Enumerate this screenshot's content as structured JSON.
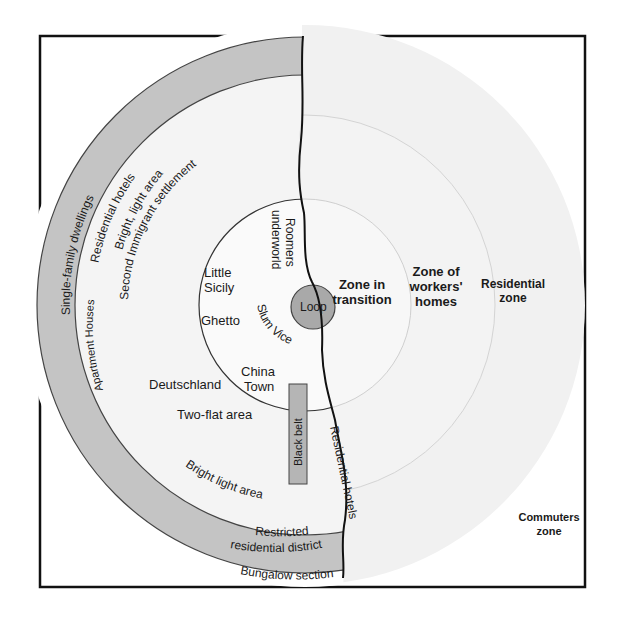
{
  "diagram": {
    "type": "concentric-zone-model",
    "colors": {
      "background": "#ffffff",
      "frame": "#111111",
      "outer_zone_light": "#f1f1f1",
      "inner_zone": "#f7f7f7",
      "grey_band": "#c4c4c4",
      "loop_fill": "#a9a9a9",
      "black_belt_fill": "#b5b5b5",
      "ring_stroke": "#555555",
      "faint_ring": "#cfcfcf",
      "river": "#111111"
    },
    "center": {
      "loop": "Loop"
    },
    "right_zones": {
      "zone_in_transition": [
        "Zone in",
        "transition"
      ],
      "zone_of_workers_homes": [
        "Zone of",
        "workers'",
        "homes"
      ],
      "residential_zone": [
        "Residential",
        "zone"
      ],
      "commuters_zone": [
        "Commuters",
        "zone"
      ]
    },
    "inner_left": {
      "roomers_underworld": [
        "Roomers",
        "underworld"
      ],
      "little_sicily": [
        "Little",
        "Sicily"
      ],
      "ghetto": "Ghetto",
      "slum_vice": "Slum Vice",
      "china_town": [
        "China",
        "Town"
      ],
      "deutschland": "Deutschland",
      "two_flat_area": "Two-flat area",
      "black_belt": "Black belt",
      "residential_hotels": "Residential hotels"
    },
    "second_ring": {
      "second_immigrant_settlement": "Second Immigrant settlement"
    },
    "outer_band": {
      "single_family_dwellings": "Single-family dwellings",
      "residential_hotels": "Residential hotels",
      "bright_light_area_top": "Bright, light area",
      "apartment_houses": "Apartment Houses",
      "bright_light_area_bottom": "Bright light area",
      "restricted_residential_district": [
        "Restricted",
        "residential district"
      ]
    },
    "beyond": {
      "bungalow_section": "Bungalow section"
    }
  }
}
